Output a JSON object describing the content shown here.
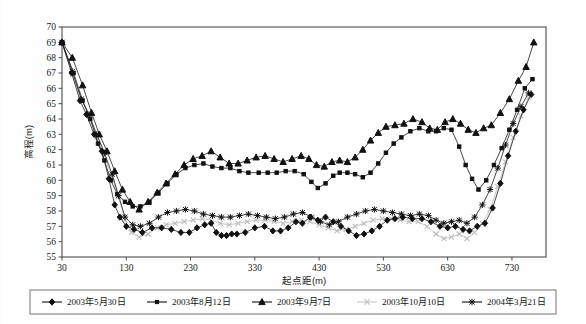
{
  "chart_data": {
    "type": "line",
    "title": "",
    "xlabel": "起点距(m)",
    "ylabel": "高程(m)",
    "xlim": [
      30,
      783
    ],
    "ylim": [
      55,
      70
    ],
    "xticks": [
      30,
      130,
      230,
      330,
      430,
      530,
      630,
      730
    ],
    "yticks": [
      55,
      56,
      57,
      58,
      59,
      60,
      61,
      62,
      63,
      64,
      65,
      66,
      67,
      68,
      69,
      70
    ],
    "grid": false,
    "legend_position": "bottom",
    "series": [
      {
        "name": "2003年5月30日",
        "marker": "diamond",
        "color": "#111111",
        "points": [
          [
            30,
            69.0
          ],
          [
            45,
            67.0
          ],
          [
            58,
            65.2
          ],
          [
            68,
            64.3
          ],
          [
            80,
            63.0
          ],
          [
            92,
            61.9
          ],
          [
            103,
            60.1
          ],
          [
            112,
            58.4
          ],
          [
            120,
            57.6
          ],
          [
            130,
            57.0
          ],
          [
            142,
            56.8
          ],
          [
            155,
            56.6
          ],
          [
            170,
            56.9
          ],
          [
            185,
            56.9
          ],
          [
            200,
            56.8
          ],
          [
            215,
            56.6
          ],
          [
            228,
            56.6
          ],
          [
            240,
            56.9
          ],
          [
            252,
            57.1
          ],
          [
            262,
            57.2
          ],
          [
            270,
            56.6
          ],
          [
            278,
            56.4
          ],
          [
            286,
            56.4
          ],
          [
            294,
            56.5
          ],
          [
            302,
            56.5
          ],
          [
            315,
            56.6
          ],
          [
            330,
            56.9
          ],
          [
            345,
            57.0
          ],
          [
            358,
            56.7
          ],
          [
            370,
            56.7
          ],
          [
            382,
            56.9
          ],
          [
            394,
            57.3
          ],
          [
            404,
            57.2
          ],
          [
            416,
            57.6
          ],
          [
            428,
            57.4
          ],
          [
            440,
            57.6
          ],
          [
            452,
            57.3
          ],
          [
            464,
            57.0
          ],
          [
            476,
            56.7
          ],
          [
            488,
            56.4
          ],
          [
            500,
            56.5
          ],
          [
            512,
            56.7
          ],
          [
            524,
            57.0
          ],
          [
            536,
            57.4
          ],
          [
            548,
            57.5
          ],
          [
            560,
            57.6
          ],
          [
            575,
            57.5
          ],
          [
            590,
            57.5
          ],
          [
            604,
            57.3
          ],
          [
            618,
            57.0
          ],
          [
            630,
            56.9
          ],
          [
            642,
            57.0
          ],
          [
            654,
            56.8
          ],
          [
            664,
            56.7
          ],
          [
            676,
            57.0
          ],
          [
            688,
            57.2
          ],
          [
            700,
            58.2
          ],
          [
            712,
            59.8
          ],
          [
            724,
            61.6
          ],
          [
            736,
            63.2
          ],
          [
            748,
            64.6
          ],
          [
            760,
            65.6
          ]
        ]
      },
      {
        "name": "2003年8月12日",
        "marker": "square",
        "color": "#2b2b2b",
        "points": [
          [
            30,
            69.0
          ],
          [
            48,
            67.0
          ],
          [
            62,
            65.2
          ],
          [
            74,
            64.0
          ],
          [
            86,
            62.4
          ],
          [
            96,
            61.3
          ],
          [
            106,
            60.0
          ],
          [
            116,
            59.1
          ],
          [
            128,
            58.6
          ],
          [
            140,
            58.3
          ],
          [
            152,
            58.3
          ],
          [
            166,
            58.6
          ],
          [
            180,
            59.2
          ],
          [
            194,
            59.8
          ],
          [
            208,
            60.4
          ],
          [
            222,
            60.8
          ],
          [
            236,
            61.0
          ],
          [
            250,
            61.1
          ],
          [
            264,
            60.9
          ],
          [
            278,
            60.8
          ],
          [
            292,
            60.8
          ],
          [
            306,
            60.6
          ],
          [
            320,
            60.5
          ],
          [
            336,
            60.5
          ],
          [
            350,
            60.5
          ],
          [
            364,
            60.5
          ],
          [
            378,
            60.6
          ],
          [
            392,
            60.6
          ],
          [
            406,
            60.4
          ],
          [
            418,
            59.9
          ],
          [
            428,
            59.5
          ],
          [
            440,
            59.8
          ],
          [
            452,
            60.3
          ],
          [
            462,
            60.5
          ],
          [
            474,
            60.5
          ],
          [
            486,
            60.4
          ],
          [
            498,
            60.2
          ],
          [
            510,
            60.5
          ],
          [
            522,
            61.1
          ],
          [
            534,
            61.8
          ],
          [
            546,
            62.4
          ],
          [
            558,
            62.8
          ],
          [
            572,
            63.2
          ],
          [
            586,
            63.4
          ],
          [
            600,
            63.2
          ],
          [
            612,
            63.2
          ],
          [
            624,
            63.4
          ],
          [
            636,
            63.3
          ],
          [
            648,
            62.2
          ],
          [
            658,
            61.0
          ],
          [
            668,
            60.1
          ],
          [
            678,
            59.4
          ],
          [
            690,
            60.0
          ],
          [
            702,
            61.0
          ],
          [
            714,
            62.1
          ],
          [
            726,
            63.3
          ],
          [
            738,
            64.6
          ],
          [
            750,
            66.0
          ],
          [
            762,
            66.6
          ]
        ]
      },
      {
        "name": "2003年9月7日",
        "marker": "triangle",
        "color": "#111111",
        "points": [
          [
            30,
            69.0
          ],
          [
            46,
            68.0
          ],
          [
            62,
            66.2
          ],
          [
            76,
            64.4
          ],
          [
            88,
            63.0
          ],
          [
            100,
            61.9
          ],
          [
            112,
            60.6
          ],
          [
            124,
            59.4
          ],
          [
            136,
            58.6
          ],
          [
            150,
            58.1
          ],
          [
            164,
            58.6
          ],
          [
            178,
            59.2
          ],
          [
            192,
            59.8
          ],
          [
            206,
            60.4
          ],
          [
            220,
            61.0
          ],
          [
            234,
            61.4
          ],
          [
            248,
            61.6
          ],
          [
            262,
            61.9
          ],
          [
            276,
            61.5
          ],
          [
            290,
            61.1
          ],
          [
            304,
            61.1
          ],
          [
            318,
            61.3
          ],
          [
            332,
            61.5
          ],
          [
            346,
            61.6
          ],
          [
            360,
            61.4
          ],
          [
            374,
            61.2
          ],
          [
            388,
            61.4
          ],
          [
            402,
            61.6
          ],
          [
            414,
            61.4
          ],
          [
            426,
            61.0
          ],
          [
            438,
            60.9
          ],
          [
            450,
            61.2
          ],
          [
            462,
            61.3
          ],
          [
            474,
            61.2
          ],
          [
            486,
            61.5
          ],
          [
            498,
            62.0
          ],
          [
            510,
            62.6
          ],
          [
            522,
            63.1
          ],
          [
            534,
            63.5
          ],
          [
            548,
            63.6
          ],
          [
            562,
            63.7
          ],
          [
            576,
            64.0
          ],
          [
            590,
            63.8
          ],
          [
            602,
            63.4
          ],
          [
            614,
            63.3
          ],
          [
            626,
            63.8
          ],
          [
            638,
            64.0
          ],
          [
            650,
            63.7
          ],
          [
            662,
            63.3
          ],
          [
            674,
            63.1
          ],
          [
            686,
            63.4
          ],
          [
            698,
            63.6
          ],
          [
            712,
            64.4
          ],
          [
            726,
            65.3
          ],
          [
            740,
            66.5
          ],
          [
            752,
            67.4
          ],
          [
            764,
            69.0
          ]
        ]
      },
      {
        "name": "2003年10月10日",
        "marker": "cross",
        "color": "#bdbdbd",
        "points": [
          [
            30,
            69.0
          ],
          [
            46,
            66.9
          ],
          [
            60,
            65.3
          ],
          [
            72,
            64.2
          ],
          [
            84,
            62.8
          ],
          [
            96,
            61.6
          ],
          [
            108,
            60.2
          ],
          [
            118,
            58.9
          ],
          [
            128,
            57.4
          ],
          [
            138,
            56.6
          ],
          [
            150,
            56.3
          ],
          [
            164,
            56.5
          ],
          [
            178,
            56.9
          ],
          [
            192,
            57.1
          ],
          [
            206,
            57.2
          ],
          [
            220,
            57.3
          ],
          [
            234,
            57.4
          ],
          [
            248,
            57.5
          ],
          [
            262,
            57.4
          ],
          [
            276,
            57.2
          ],
          [
            290,
            57.1
          ],
          [
            304,
            57.2
          ],
          [
            318,
            57.3
          ],
          [
            332,
            57.4
          ],
          [
            346,
            57.4
          ],
          [
            360,
            57.3
          ],
          [
            374,
            57.2
          ],
          [
            388,
            57.3
          ],
          [
            402,
            57.4
          ],
          [
            416,
            57.3
          ],
          [
            430,
            57.1
          ],
          [
            444,
            56.9
          ],
          [
            458,
            56.7
          ],
          [
            472,
            56.8
          ],
          [
            486,
            57.0
          ],
          [
            500,
            57.2
          ],
          [
            514,
            57.4
          ],
          [
            528,
            57.5
          ],
          [
            542,
            57.5
          ],
          [
            556,
            57.4
          ],
          [
            570,
            57.3
          ],
          [
            584,
            57.3
          ],
          [
            598,
            57.0
          ],
          [
            612,
            56.5
          ],
          [
            624,
            56.2
          ],
          [
            636,
            56.3
          ],
          [
            648,
            56.5
          ],
          [
            660,
            56.2
          ],
          [
            672,
            56.6
          ],
          [
            684,
            57.2
          ],
          [
            696,
            58.1
          ],
          [
            708,
            59.6
          ],
          [
            720,
            61.2
          ],
          [
            732,
            62.8
          ],
          [
            744,
            64.2
          ],
          [
            756,
            65.4
          ]
        ]
      },
      {
        "name": "2004年3月21日",
        "marker": "asterisk",
        "color": "#1a1a1a",
        "points": [
          [
            30,
            69.0
          ],
          [
            46,
            67.1
          ],
          [
            60,
            65.3
          ],
          [
            72,
            64.3
          ],
          [
            84,
            63.0
          ],
          [
            96,
            61.8
          ],
          [
            108,
            60.4
          ],
          [
            118,
            59.0
          ],
          [
            128,
            57.6
          ],
          [
            140,
            57.1
          ],
          [
            152,
            57.0
          ],
          [
            166,
            57.2
          ],
          [
            180,
            57.6
          ],
          [
            194,
            57.9
          ],
          [
            208,
            58.0
          ],
          [
            222,
            58.1
          ],
          [
            236,
            58.0
          ],
          [
            250,
            57.8
          ],
          [
            264,
            57.7
          ],
          [
            278,
            57.6
          ],
          [
            292,
            57.6
          ],
          [
            306,
            57.7
          ],
          [
            320,
            57.8
          ],
          [
            334,
            57.7
          ],
          [
            348,
            57.6
          ],
          [
            362,
            57.5
          ],
          [
            376,
            57.6
          ],
          [
            390,
            57.8
          ],
          [
            404,
            57.9
          ],
          [
            418,
            57.6
          ],
          [
            432,
            57.3
          ],
          [
            446,
            57.1
          ],
          [
            460,
            57.3
          ],
          [
            474,
            57.6
          ],
          [
            488,
            57.8
          ],
          [
            502,
            58.0
          ],
          [
            516,
            58.1
          ],
          [
            530,
            58.0
          ],
          [
            544,
            57.9
          ],
          [
            558,
            57.8
          ],
          [
            572,
            57.7
          ],
          [
            586,
            57.8
          ],
          [
            600,
            57.7
          ],
          [
            612,
            57.4
          ],
          [
            624,
            57.2
          ],
          [
            636,
            57.3
          ],
          [
            648,
            57.4
          ],
          [
            660,
            57.2
          ],
          [
            672,
            57.6
          ],
          [
            684,
            58.4
          ],
          [
            696,
            59.4
          ],
          [
            708,
            60.8
          ],
          [
            720,
            62.3
          ],
          [
            732,
            63.7
          ],
          [
            744,
            64.8
          ],
          [
            756,
            65.7
          ]
        ]
      }
    ]
  },
  "legend": {
    "items": [
      {
        "label": "2003年5月30日",
        "marker": "diamond"
      },
      {
        "label": "2003年8月12日",
        "marker": "square"
      },
      {
        "label": "2003年9月7日",
        "marker": "triangle"
      },
      {
        "label": "2003年10月10日",
        "marker": "cross"
      },
      {
        "label": "2004年3月21日",
        "marker": "asterisk"
      }
    ]
  }
}
